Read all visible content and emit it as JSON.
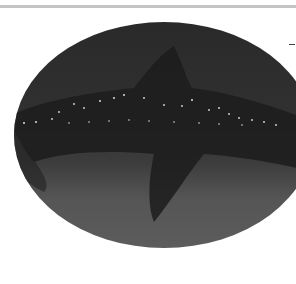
{
  "image": {
    "subject": "whale shark silhouette",
    "style": "grayscale photo in oval frame",
    "colors": {
      "background": "#ffffff",
      "top_rule": "#c4c4c4",
      "water_dark": "#2a2a2a",
      "water_light": "#5c5c5c",
      "shark_body": "#1a1a1a",
      "spots": "#d8d8d8"
    }
  }
}
